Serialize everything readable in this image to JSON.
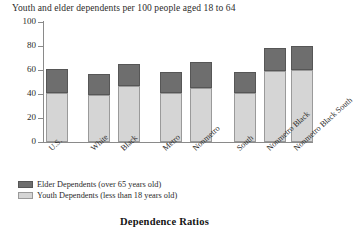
{
  "chart_data": {
    "type": "bar",
    "stacked": true,
    "title": "Youth  and elder dependents per 100 people aged 18 to 64",
    "caption": "Dependence Ratios",
    "xlabel": "",
    "ylabel": "",
    "ylim": [
      0,
      100
    ],
    "yticks": [
      0,
      20,
      40,
      60,
      80,
      100
    ],
    "grid": false,
    "legend_position": "below-axes-left",
    "categories": [
      "U.S.",
      "White",
      "Black",
      "Metro",
      "Nonmetro",
      "South",
      "Nonmetro Black",
      "Nonmetro Black South"
    ],
    "series": [
      {
        "name": "Youth Dependents (less than 18 years old)",
        "color": "#d5d5d5",
        "values": [
          41,
          39,
          47,
          41,
          45,
          41,
          59,
          60
        ]
      },
      {
        "name": "Elder Dependents (over 65 years old)",
        "color": "#6e6e6e",
        "values": [
          20,
          18,
          18,
          17,
          22,
          17,
          19,
          20
        ]
      }
    ],
    "totals": [
      61,
      57,
      65,
      58,
      67,
      58,
      78,
      80
    ],
    "group_breaks_after": [
      0,
      2,
      4
    ]
  },
  "legend": {
    "items": [
      {
        "label": "Elder Dependents (over 65 years old)",
        "swatch": "elder"
      },
      {
        "label": "Youth Dependents (less than 18 years old)",
        "swatch": "youth"
      }
    ]
  },
  "colors": {
    "elder": "#6e6e6e",
    "youth": "#d5d5d5",
    "axis": "#8a8a8a",
    "text": "#2b2b2b"
  }
}
